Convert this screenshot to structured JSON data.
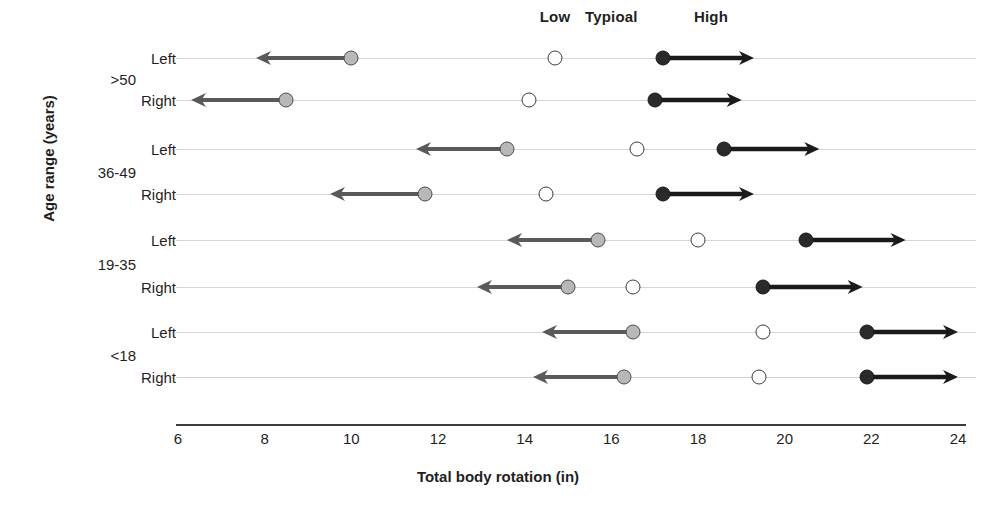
{
  "chart_data": {
    "type": "scatter",
    "title": "",
    "xlabel": "Total body rotation (in)",
    "ylabel": "Age range (years)",
    "xlim": [
      6,
      24
    ],
    "xticks": [
      6,
      8,
      10,
      12,
      14,
      16,
      18,
      20,
      22,
      24
    ],
    "grid": true,
    "legend_position": "top",
    "column_headers": [
      {
        "label": "Low",
        "x": 14.7
      },
      {
        "label": "Typioal",
        "x": 16.0
      },
      {
        "label": "High",
        "x": 18.3
      }
    ],
    "series": [
      {
        "name": "Low",
        "marker": "filled-grey-circle",
        "color": "#b8b8b8",
        "arrow": "left",
        "values": [
          10.0,
          8.5,
          13.6,
          11.7,
          15.7,
          15.0,
          16.5,
          16.3
        ]
      },
      {
        "name": "Typioal",
        "marker": "open-circle",
        "color": "#ffffff",
        "arrow": "none",
        "values": [
          14.7,
          14.1,
          16.6,
          14.5,
          18.0,
          16.5,
          19.5,
          19.4
        ]
      },
      {
        "name": "High",
        "marker": "filled-black-circle",
        "color": "#2a2a2a",
        "arrow": "right",
        "values": [
          17.2,
          17.0,
          18.6,
          17.2,
          20.5,
          19.5,
          21.9,
          21.9
        ]
      }
    ],
    "groups": [
      {
        "label": ">50",
        "rows": [
          "Left",
          "Right"
        ]
      },
      {
        "label": "36-49",
        "rows": [
          "Left",
          "Right"
        ]
      },
      {
        "label": "19-35",
        "rows": [
          "Left",
          "Right"
        ]
      },
      {
        "label": "<18",
        "rows": [
          "Left",
          "Right"
        ]
      }
    ],
    "rows": [
      {
        "group": ">50",
        "side": "Left",
        "low": 10.0,
        "typical": 14.7,
        "high": 17.2,
        "low_arrow_end": 7.8,
        "high_arrow_end": 19.3
      },
      {
        "group": ">50",
        "side": "Right",
        "low": 8.5,
        "typical": 14.1,
        "high": 17.0,
        "low_arrow_end": 6.3,
        "high_arrow_end": 19.0
      },
      {
        "group": "36-49",
        "side": "Left",
        "low": 13.6,
        "typical": 16.6,
        "high": 18.6,
        "low_arrow_end": 11.5,
        "high_arrow_end": 20.8
      },
      {
        "group": "36-49",
        "side": "Right",
        "low": 11.7,
        "typical": 14.5,
        "high": 17.2,
        "low_arrow_end": 9.5,
        "high_arrow_end": 19.3
      },
      {
        "group": "19-35",
        "side": "Left",
        "low": 15.7,
        "typical": 18.0,
        "high": 20.5,
        "low_arrow_end": 13.6,
        "high_arrow_end": 22.8
      },
      {
        "group": "19-35",
        "side": "Right",
        "low": 15.0,
        "typical": 16.5,
        "high": 19.5,
        "low_arrow_end": 12.9,
        "high_arrow_end": 21.8
      },
      {
        "group": "<18",
        "side": "Left",
        "low": 16.5,
        "typical": 19.5,
        "high": 21.9,
        "low_arrow_end": 14.4,
        "high_arrow_end": 24.0
      },
      {
        "group": "<18",
        "side": "Right",
        "low": 16.3,
        "typical": 19.4,
        "high": 21.9,
        "low_arrow_end": 14.2,
        "high_arrow_end": 24.0
      }
    ]
  },
  "axes": {
    "x_title": "Total body rotation (in)",
    "y_title": "Age range (years)",
    "x_tick_labels": [
      "6",
      "8",
      "10",
      "12",
      "14",
      "16",
      "18",
      "20",
      "22",
      "24"
    ]
  },
  "colors": {
    "low_marker": "#b8b8b8",
    "typical_marker": "#ffffff",
    "high_marker": "#2a2a2a",
    "low_arrow": "#5a5a5a",
    "high_arrow": "#1a1a1a",
    "row_line": "#d6d6d6",
    "axis_line": "#3d3d3d",
    "text": "#1f1f1f"
  }
}
